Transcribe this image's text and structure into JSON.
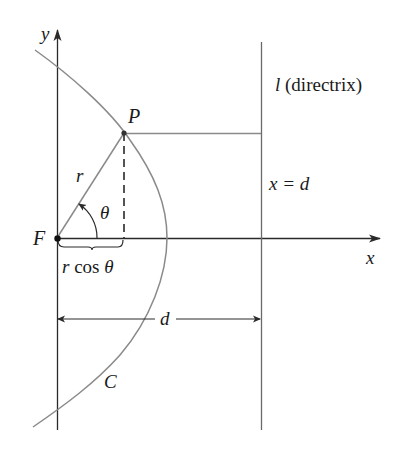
{
  "figure": {
    "type": "polar-conic-parabola",
    "colors": {
      "axis": "#2a2a2a",
      "curve": "#8a8a8a",
      "guide": "#8a8a8a",
      "text": "#1a1a1a",
      "background": "#ffffff"
    }
  },
  "labels": {
    "y_axis": "y",
    "x_axis": "x",
    "point_P": "P",
    "focus_F": "F",
    "radius_r": "r",
    "angle_theta": "θ",
    "r_cos_theta": "r cos θ",
    "directrix_l": "l",
    "directrix_text": " (directrix)",
    "directrix_eq": "x = d",
    "distance_d": "d",
    "curve_C": "C"
  },
  "geometry": {
    "origin": [
      57,
      238
    ],
    "point_P": [
      124,
      133
    ],
    "directrix_x": 261,
    "vertex": [
      167,
      238
    ]
  }
}
